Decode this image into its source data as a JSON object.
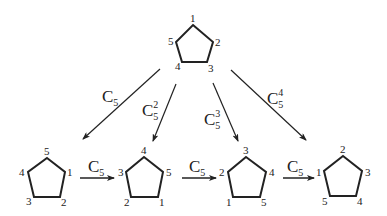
{
  "diagram": {
    "type": "group-rotation-diagram",
    "top_pentagon": {
      "labels": [
        "1",
        "2",
        "3",
        "4",
        "5"
      ],
      "positions": [
        "top",
        "right",
        "bottom-right",
        "bottom-left",
        "left"
      ]
    },
    "arrows_down": [
      {
        "label": "C",
        "sub": "5",
        "sup": ""
      },
      {
        "label": "C",
        "sub": "5",
        "sup": "2"
      },
      {
        "label": "C",
        "sub": "5",
        "sup": "3"
      },
      {
        "label": "C",
        "sub": "5",
        "sup": "4"
      }
    ],
    "bottom_pentagons": [
      {
        "top": "5",
        "right": "1",
        "br": "2",
        "bl": "3",
        "left": "4"
      },
      {
        "top": "4",
        "right": "5",
        "br": "1",
        "bl": "2",
        "left": "3"
      },
      {
        "top": "3",
        "right": "4",
        "br": "5",
        "bl": "1",
        "left": "2"
      },
      {
        "top": "2",
        "right": "3",
        "br": "4",
        "bl": "5",
        "left": "1"
      }
    ],
    "arrows_right": [
      {
        "label": "C",
        "sub": "5"
      },
      {
        "label": "C",
        "sub": "5"
      },
      {
        "label": "C",
        "sub": "5"
      }
    ]
  }
}
